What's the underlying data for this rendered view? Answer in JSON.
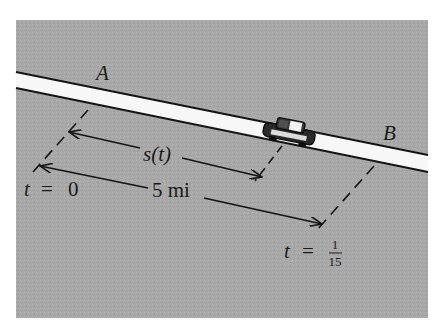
{
  "figure": {
    "background_color": "#a9a9a9",
    "road_color": "#f7f7f7",
    "line_color": "#141414",
    "labels": {
      "point_a": "A",
      "point_b": "B",
      "distance_function": "s(t)",
      "total_distance": "5 mi",
      "start_time_var": "t",
      "start_time_eq": "=",
      "start_time_value": "0",
      "end_time_var": "t",
      "end_time_eq": "=",
      "end_time_numerator": "1",
      "end_time_denominator": "15"
    },
    "icons": {
      "vehicle": "car-icon"
    }
  }
}
